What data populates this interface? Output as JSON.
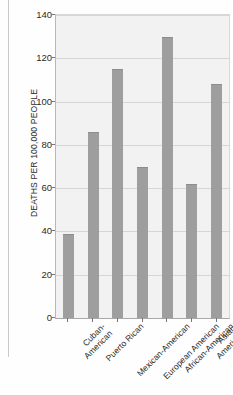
{
  "chart_data": {
    "type": "bar",
    "title": "",
    "xlabel": "",
    "ylabel": "DEATHS PER 100,000 PEOPLE",
    "categories": [
      "Cuban-\nAmerican",
      "Puerto Rican",
      "Mexican-American",
      "European American",
      "African-American",
      "Asian-American",
      "Native American"
    ],
    "values": [
      39,
      86,
      115,
      70,
      130,
      62,
      108
    ],
    "ylim": [
      0,
      140
    ],
    "yticks": [
      0,
      20,
      40,
      60,
      80,
      100,
      120,
      140
    ],
    "ytick_labels": [
      "0",
      "20",
      "40",
      "60",
      "80",
      "100",
      "120",
      "140"
    ],
    "grid": true,
    "legend": false,
    "bar_color": "#9e9e9e",
    "plot_background": "#f2f2f2",
    "gridline_color": "#d6d6d6"
  }
}
